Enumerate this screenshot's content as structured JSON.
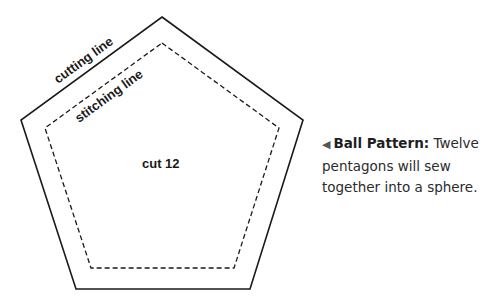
{
  "diagram": {
    "cutting_label": "cutting line",
    "stitching_label": "stitching line",
    "center_label": "cut 12",
    "outer_points": "162,17 303,120 250,289 76,289 21,120",
    "inner_points": "162,43 279,128 234,268 91,268 45,128"
  },
  "caption": {
    "arrow": "◀",
    "title": "Ball Pattern:",
    "body": " Twelve pentagons will sew together into a sphere."
  },
  "colors": {
    "line": "#1a1a1a",
    "text": "#2b2b2b"
  }
}
